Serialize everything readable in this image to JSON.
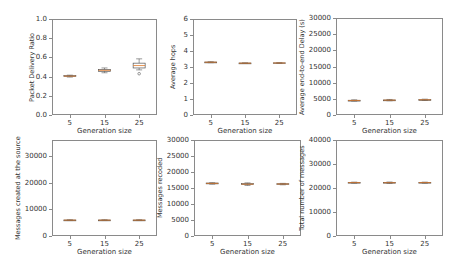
{
  "chart_data": [
    {
      "type": "box",
      "title": "",
      "xlabel": "Generation size",
      "ylabel": "Packet Delivery Ratio",
      "categories": [
        "5",
        "15",
        "25"
      ],
      "ylim": [
        0,
        1.0
      ],
      "yticks": [
        "0.0",
        "0.2",
        "0.4",
        "0.6",
        "0.8",
        "1.0"
      ],
      "ytick_values": [
        0,
        0.2,
        0.4,
        0.6,
        0.8,
        1.0
      ],
      "boxes": [
        {
          "whislo": 0.395,
          "q1": 0.4,
          "med": 0.405,
          "q3": 0.41,
          "whishi": 0.415,
          "fliers": []
        },
        {
          "whislo": 0.44,
          "q1": 0.455,
          "med": 0.465,
          "q3": 0.475,
          "whishi": 0.49,
          "fliers": []
        },
        {
          "whislo": 0.47,
          "q1": 0.49,
          "med": 0.515,
          "q3": 0.54,
          "whishi": 0.585,
          "fliers": [
            0.43
          ]
        }
      ],
      "grid": false
    },
    {
      "type": "box",
      "title": "",
      "xlabel": "Generation size",
      "ylabel": "Average hops",
      "categories": [
        "5",
        "15",
        "25"
      ],
      "ylim": [
        0,
        6
      ],
      "yticks": [
        "0",
        "1",
        "2",
        "3",
        "4",
        "5",
        "6"
      ],
      "ytick_values": [
        0,
        1,
        2,
        3,
        4,
        5,
        6
      ],
      "boxes": [
        {
          "whislo": 3.27,
          "q1": 3.29,
          "med": 3.3,
          "q3": 3.31,
          "whishi": 3.33,
          "fliers": []
        },
        {
          "whislo": 3.22,
          "q1": 3.23,
          "med": 3.24,
          "q3": 3.25,
          "whishi": 3.26,
          "fliers": []
        },
        {
          "whislo": 3.23,
          "q1": 3.24,
          "med": 3.25,
          "q3": 3.26,
          "whishi": 3.27,
          "fliers": []
        }
      ],
      "grid": false
    },
    {
      "type": "box",
      "title": "",
      "xlabel": "Generation size",
      "ylabel": "Average end-to-end Delay (s)",
      "categories": [
        "5",
        "15",
        "25"
      ],
      "ylim": [
        0,
        30000
      ],
      "yticks": [
        "0",
        "5000",
        "10000",
        "15000",
        "20000",
        "25000",
        "30000"
      ],
      "ytick_values": [
        0,
        5000,
        10000,
        15000,
        20000,
        25000,
        30000
      ],
      "boxes": [
        {
          "whislo": 4300,
          "q1": 4450,
          "med": 4500,
          "q3": 4550,
          "whishi": 4700,
          "fliers": []
        },
        {
          "whislo": 4400,
          "q1": 4550,
          "med": 4600,
          "q3": 4650,
          "whishi": 4800,
          "fliers": []
        },
        {
          "whislo": 4500,
          "q1": 4650,
          "med": 4700,
          "q3": 4750,
          "whishi": 4900,
          "fliers": []
        }
      ],
      "grid": false
    },
    {
      "type": "box",
      "title": "",
      "xlabel": "Generation size",
      "ylabel": "Messages created at the source",
      "categories": [
        "5",
        "15",
        "25"
      ],
      "ylim": [
        0,
        36000
      ],
      "yticks": [
        "0",
        "10000",
        "20000",
        "30000"
      ],
      "ytick_values": [
        0,
        10000,
        20000,
        30000
      ],
      "boxes": [
        {
          "whislo": 5800,
          "q1": 5900,
          "med": 5950,
          "q3": 6000,
          "whishi": 6100,
          "fliers": []
        },
        {
          "whislo": 5800,
          "q1": 5900,
          "med": 5950,
          "q3": 6000,
          "whishi": 6100,
          "fliers": []
        },
        {
          "whislo": 5800,
          "q1": 5900,
          "med": 5950,
          "q3": 6000,
          "whishi": 6100,
          "fliers": []
        }
      ],
      "grid": false
    },
    {
      "type": "box",
      "title": "",
      "xlabel": "Generation size",
      "ylabel": "Messages recoded",
      "categories": [
        "5",
        "15",
        "25"
      ],
      "ylim": [
        0,
        30000
      ],
      "yticks": [
        "0",
        "5000",
        "10000",
        "15000",
        "20000",
        "25000",
        "30000"
      ],
      "ytick_values": [
        0,
        5000,
        10000,
        15000,
        20000,
        25000,
        30000
      ],
      "boxes": [
        {
          "whislo": 16200,
          "q1": 16350,
          "med": 16450,
          "q3": 16550,
          "whishi": 16650,
          "fliers": []
        },
        {
          "whislo": 15800,
          "q1": 16100,
          "med": 16200,
          "q3": 16400,
          "whishi": 16600,
          "fliers": []
        },
        {
          "whislo": 16000,
          "q1": 16150,
          "med": 16250,
          "q3": 16350,
          "whishi": 16450,
          "fliers": []
        }
      ],
      "grid": false
    },
    {
      "type": "box",
      "title": "",
      "xlabel": "Generation size",
      "ylabel": "Total number of messages",
      "categories": [
        "5",
        "15",
        "25"
      ],
      "ylim": [
        0,
        40000
      ],
      "yticks": [
        "0",
        "10000",
        "20000",
        "30000",
        "40000"
      ],
      "ytick_values": [
        0,
        10000,
        20000,
        30000,
        40000
      ],
      "boxes": [
        {
          "whislo": 22000,
          "q1": 22150,
          "med": 22250,
          "q3": 22350,
          "whishi": 22450,
          "fliers": []
        },
        {
          "whislo": 21900,
          "q1": 22100,
          "med": 22200,
          "q3": 22350,
          "whishi": 22500,
          "fliers": []
        },
        {
          "whislo": 22000,
          "q1": 22150,
          "med": 22250,
          "q3": 22350,
          "whishi": 22450,
          "fliers": []
        }
      ],
      "grid": false
    }
  ],
  "layout": {
    "frames": [
      {
        "left": 52,
        "top": 19,
        "width": 105,
        "height": 96
      },
      {
        "left": 193,
        "top": 19,
        "width": 104,
        "height": 96
      },
      {
        "left": 336,
        "top": 18,
        "width": 107,
        "height": 97
      },
      {
        "left": 52,
        "top": 140,
        "width": 105,
        "height": 96
      },
      {
        "left": 194,
        "top": 140,
        "width": 107,
        "height": 96
      },
      {
        "left": 336,
        "top": 140,
        "width": 107,
        "height": 96
      }
    ],
    "x_positions": [
      0.17,
      0.5,
      0.83
    ],
    "colors": {
      "frame": "#8a8a8a",
      "box": "#555555",
      "median": "#e07a2a",
      "text": "#333333"
    }
  }
}
